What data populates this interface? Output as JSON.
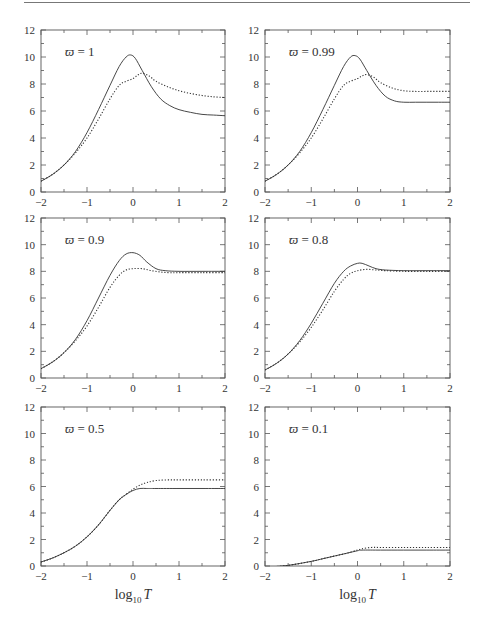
{
  "chart_data": [
    {
      "type": "line",
      "panel": "top-left",
      "annotation": "ϖ = 1",
      "xlim": [
        -2,
        2
      ],
      "ylim": [
        0,
        12
      ],
      "xticks": [
        -2,
        -1,
        0,
        1,
        2
      ],
      "yticks": [
        0,
        2,
        4,
        6,
        8,
        10,
        12
      ],
      "xlabel": "",
      "series": [
        {
          "name": "solid",
          "style": "solid",
          "x": [
            -2,
            -1.75,
            -1.5,
            -1.25,
            -1,
            -0.75,
            -0.5,
            -0.3,
            -0.15,
            -0.05,
            0.05,
            0.2,
            0.4,
            0.6,
            0.8,
            1,
            1.25,
            1.5,
            1.75,
            2
          ],
          "y": [
            0.8,
            1.3,
            2.0,
            3.0,
            4.4,
            6.1,
            7.9,
            9.3,
            10.0,
            10.15,
            9.9,
            9.0,
            7.8,
            6.9,
            6.4,
            6.1,
            5.9,
            5.75,
            5.7,
            5.65
          ]
        },
        {
          "name": "dotted",
          "style": "dotted",
          "x": [
            -2,
            -1.75,
            -1.5,
            -1.25,
            -1,
            -0.75,
            -0.5,
            -0.3,
            -0.15,
            0,
            0.1,
            0.2,
            0.35,
            0.5,
            0.75,
            1,
            1.25,
            1.5,
            1.75,
            2
          ],
          "y": [
            0.8,
            1.3,
            2.0,
            2.9,
            4.0,
            5.4,
            6.9,
            7.9,
            8.2,
            8.4,
            8.65,
            8.8,
            8.6,
            8.2,
            7.8,
            7.5,
            7.3,
            7.15,
            7.05,
            7.0
          ]
        }
      ]
    },
    {
      "type": "line",
      "panel": "top-right",
      "annotation": "ϖ = 0.99",
      "xlim": [
        -2,
        2
      ],
      "ylim": [
        0,
        12
      ],
      "xticks": [
        -2,
        -1,
        0,
        1,
        2
      ],
      "yticks": [
        0,
        2,
        4,
        6,
        8,
        10,
        12
      ],
      "xlabel": "",
      "series": [
        {
          "name": "solid",
          "style": "solid",
          "x": [
            -2,
            -1.75,
            -1.5,
            -1.25,
            -1,
            -0.75,
            -0.5,
            -0.3,
            -0.15,
            -0.05,
            0.05,
            0.2,
            0.4,
            0.6,
            0.8,
            1,
            1.25,
            1.5,
            1.75,
            2
          ],
          "y": [
            0.8,
            1.3,
            2.0,
            3.0,
            4.4,
            6.1,
            7.9,
            9.3,
            10.0,
            10.1,
            9.85,
            9.0,
            7.9,
            7.1,
            6.75,
            6.65,
            6.65,
            6.65,
            6.65,
            6.65
          ]
        },
        {
          "name": "dotted",
          "style": "dotted",
          "x": [
            -2,
            -1.75,
            -1.5,
            -1.25,
            -1,
            -0.75,
            -0.5,
            -0.3,
            -0.15,
            0,
            0.1,
            0.2,
            0.35,
            0.5,
            0.75,
            1,
            1.25,
            1.5,
            1.75,
            2
          ],
          "y": [
            0.8,
            1.3,
            2.0,
            2.9,
            4.0,
            5.4,
            6.9,
            7.9,
            8.2,
            8.4,
            8.6,
            8.7,
            8.5,
            8.1,
            7.7,
            7.5,
            7.45,
            7.45,
            7.45,
            7.45
          ]
        }
      ]
    },
    {
      "type": "line",
      "panel": "middle-left",
      "annotation": "ϖ = 0.9",
      "xlim": [
        -2,
        2
      ],
      "ylim": [
        0,
        12
      ],
      "xticks": [
        -2,
        -1,
        0,
        1,
        2
      ],
      "yticks": [
        0,
        2,
        4,
        6,
        8,
        10,
        12
      ],
      "xlabel": "",
      "series": [
        {
          "name": "solid",
          "style": "solid",
          "x": [
            -2,
            -1.75,
            -1.5,
            -1.25,
            -1,
            -0.75,
            -0.5,
            -0.3,
            -0.15,
            0,
            0.15,
            0.3,
            0.5,
            0.7,
            1,
            1.5,
            2
          ],
          "y": [
            0.7,
            1.2,
            1.9,
            2.9,
            4.3,
            6.0,
            7.7,
            8.8,
            9.3,
            9.4,
            9.2,
            8.7,
            8.2,
            8.05,
            8.0,
            8.0,
            8.0
          ]
        },
        {
          "name": "dotted",
          "style": "dotted",
          "x": [
            -2,
            -1.75,
            -1.5,
            -1.25,
            -1,
            -0.75,
            -0.5,
            -0.3,
            -0.15,
            0,
            0.2,
            0.4,
            0.6,
            0.8,
            1,
            1.5,
            2
          ],
          "y": [
            0.7,
            1.2,
            1.9,
            2.8,
            3.9,
            5.3,
            6.8,
            7.7,
            8.1,
            8.2,
            8.2,
            8.05,
            7.95,
            7.9,
            7.9,
            7.9,
            7.9
          ]
        }
      ]
    },
    {
      "type": "line",
      "panel": "middle-right",
      "annotation": "ϖ = 0.8",
      "xlim": [
        -2,
        2
      ],
      "ylim": [
        0,
        12
      ],
      "xticks": [
        -2,
        -1,
        0,
        1,
        2
      ],
      "yticks": [
        0,
        2,
        4,
        6,
        8,
        10,
        12
      ],
      "xlabel": "",
      "series": [
        {
          "name": "solid",
          "style": "solid",
          "x": [
            -2,
            -1.75,
            -1.5,
            -1.25,
            -1,
            -0.75,
            -0.5,
            -0.3,
            -0.15,
            0,
            0.1,
            0.25,
            0.4,
            0.6,
            1,
            1.5,
            2
          ],
          "y": [
            0.6,
            1.1,
            1.8,
            2.8,
            4.1,
            5.6,
            7.1,
            8.0,
            8.4,
            8.6,
            8.6,
            8.4,
            8.2,
            8.1,
            8.05,
            8.05,
            8.05
          ]
        },
        {
          "name": "dotted",
          "style": "dotted",
          "x": [
            -2,
            -1.75,
            -1.5,
            -1.25,
            -1,
            -0.75,
            -0.5,
            -0.3,
            -0.15,
            0,
            0.2,
            0.4,
            0.6,
            1,
            1.5,
            2
          ],
          "y": [
            0.6,
            1.1,
            1.8,
            2.7,
            3.8,
            5.1,
            6.5,
            7.4,
            7.85,
            8.05,
            8.15,
            8.1,
            8.05,
            8.0,
            8.0,
            8.0
          ]
        }
      ]
    },
    {
      "type": "line",
      "panel": "bottom-left",
      "annotation": "ϖ = 0.5",
      "xlim": [
        -2,
        2
      ],
      "ylim": [
        0,
        12
      ],
      "xticks": [
        -2,
        -1,
        0,
        1,
        2
      ],
      "yticks": [
        0,
        2,
        4,
        6,
        8,
        10,
        12
      ],
      "xlabel": "log₁₀ T",
      "series": [
        {
          "name": "solid",
          "style": "solid",
          "x": [
            -2,
            -1.75,
            -1.5,
            -1.25,
            -1,
            -0.75,
            -0.5,
            -0.3,
            -0.15,
            0,
            0.15,
            0.3,
            0.5,
            1,
            1.5,
            2
          ],
          "y": [
            0.3,
            0.6,
            1.0,
            1.5,
            2.2,
            3.1,
            4.2,
            5.0,
            5.4,
            5.7,
            5.85,
            5.85,
            5.85,
            5.85,
            5.85,
            5.85
          ]
        },
        {
          "name": "dotted",
          "style": "dotted",
          "x": [
            -2,
            -1.75,
            -1.5,
            -1.25,
            -1,
            -0.75,
            -0.5,
            -0.3,
            -0.15,
            0,
            0.15,
            0.3,
            0.5,
            0.75,
            1,
            1.5,
            2
          ],
          "y": [
            0.3,
            0.6,
            1.0,
            1.5,
            2.2,
            3.1,
            4.2,
            5.0,
            5.4,
            5.8,
            6.1,
            6.3,
            6.45,
            6.5,
            6.5,
            6.5,
            6.5
          ]
        }
      ]
    },
    {
      "type": "line",
      "panel": "bottom-right",
      "annotation": "ϖ = 0.1",
      "xlim": [
        -2,
        2
      ],
      "ylim": [
        0,
        12
      ],
      "xticks": [
        -2,
        -1,
        0,
        1,
        2
      ],
      "yticks": [
        0,
        2,
        4,
        6,
        8,
        10,
        12
      ],
      "xlabel": "log₁₀ T",
      "series": [
        {
          "name": "solid",
          "style": "solid",
          "x": [
            -2,
            -1.5,
            -1,
            -0.75,
            -0.5,
            -0.25,
            0,
            0.1,
            0.5,
            1,
            1.5,
            2
          ],
          "y": [
            -0.1,
            0.05,
            0.35,
            0.55,
            0.75,
            0.95,
            1.15,
            1.2,
            1.2,
            1.2,
            1.2,
            1.2
          ]
        },
        {
          "name": "dotted",
          "style": "dotted",
          "x": [
            -2,
            -1.5,
            -1,
            -0.75,
            -0.5,
            -0.25,
            0,
            0.1,
            0.3,
            0.5,
            1,
            1.5,
            2
          ],
          "y": [
            -0.1,
            0.05,
            0.35,
            0.55,
            0.75,
            0.95,
            1.2,
            1.3,
            1.4,
            1.4,
            1.4,
            1.4,
            1.4
          ]
        }
      ]
    }
  ],
  "panels": {
    "p0": {
      "annotation": "ϖ = 1"
    },
    "p1": {
      "annotation": "ϖ = 0.99"
    },
    "p2": {
      "annotation": "ϖ = 0.9"
    },
    "p3": {
      "annotation": "ϖ = 0.8"
    },
    "p4": {
      "annotation": "ϖ = 0.5"
    },
    "p5": {
      "annotation": "ϖ = 0.1"
    }
  },
  "axis": {
    "xlabel_log": "log",
    "xlabel_sub": "10",
    "xlabel_var": "T",
    "xtick_labels": [
      "−2",
      "−1",
      "0",
      "1",
      "2"
    ],
    "ytick_labels": [
      "0",
      "2",
      "4",
      "6",
      "8",
      "10",
      "12"
    ]
  },
  "colors": {
    "line": "#333333",
    "frame": "#555555",
    "rule": "#777777"
  }
}
